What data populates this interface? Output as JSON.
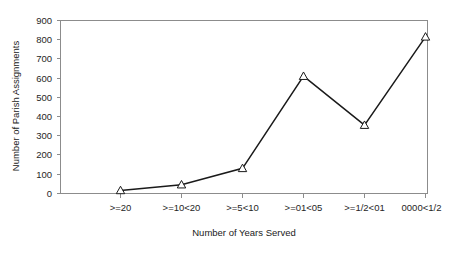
{
  "chart_data": {
    "type": "line",
    "title": "",
    "xlabel": "Number of Years Served",
    "ylabel": "Number of Parish Assignments",
    "categories": [
      ">=20",
      ">=10<20",
      ">=5<10",
      ">=01<05",
      ">=1/2<01",
      "0000<1/2"
    ],
    "values": [
      15,
      45,
      130,
      610,
      355,
      815
    ],
    "ylim": [
      0,
      900
    ],
    "y_ticks": [
      0,
      100,
      200,
      300,
      400,
      500,
      600,
      700,
      800,
      900
    ],
    "y_tick_labels": [
      "0",
      "100",
      "200",
      "300",
      "400",
      "500",
      "600",
      "700",
      "800",
      "900"
    ],
    "grid": false,
    "legend": "none",
    "marker": "triangle-open",
    "line_color": "#1a1a1a",
    "marker_fill": "#ffffff",
    "axis_color": "#8c8c8c"
  }
}
